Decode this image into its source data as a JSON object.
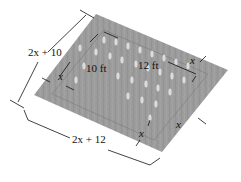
{
  "diagram": {
    "labels": {
      "outer_width": "2x + 10",
      "outer_length": "2x + 12",
      "inner_width": "10 ft",
      "inner_length": "12 ft",
      "border_top_left": "x",
      "border_top_right": "x",
      "border_bottom": "x",
      "border_right": "x"
    },
    "colors": {
      "ground": "#9a9a9a",
      "ground_dark": "#8a8a8a",
      "plants": "#d9d9d9",
      "lines": "#111111"
    }
  }
}
